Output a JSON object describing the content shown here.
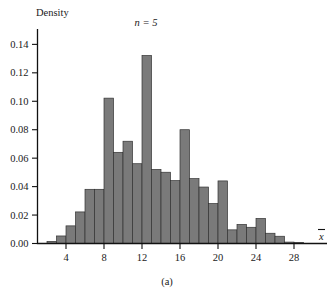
{
  "figure": {
    "caption": "(a)",
    "annotation": "n = 5",
    "xbar_symbol": "x",
    "bar_fill_color": "#7a7a7a",
    "bar_edge_color": "#333333",
    "axis_color": "#111111"
  },
  "chart_data": {
    "type": "bar",
    "title": "",
    "subtitle": "",
    "annotations": [
      "n = 5"
    ],
    "xlabel": "x̄",
    "ylabel": "Density",
    "xlim": [
      1.0,
      30.0
    ],
    "ylim": [
      0.0,
      0.148
    ],
    "grid": false,
    "legend": null,
    "bin_width": 1,
    "x_tick_labels": [
      "4",
      "8",
      "12",
      "16",
      "20",
      "24",
      "28"
    ],
    "x_ticks": [
      4,
      8,
      12,
      16,
      20,
      24,
      28
    ],
    "y_tick_labels": [
      "0.00",
      "0.02",
      "0.04",
      "0.06",
      "0.08",
      "0.10",
      "0.12",
      "0.14"
    ],
    "y_ticks": [
      0.0,
      0.02,
      0.04,
      0.06,
      0.08,
      0.1,
      0.12,
      0.14
    ],
    "bin_starts": [
      2,
      3,
      4,
      5,
      6,
      7,
      8,
      9,
      10,
      11,
      12,
      13,
      14,
      15,
      16,
      17,
      18,
      19,
      20,
      21,
      22,
      23,
      24,
      25,
      26,
      27,
      28
    ],
    "categories": [
      "2-3",
      "3-4",
      "4-5",
      "5-6",
      "6-7",
      "7-8",
      "8-9",
      "9-10",
      "10-11",
      "11-12",
      "12-13",
      "13-14",
      "14-15",
      "15-16",
      "16-17",
      "17-18",
      "18-19",
      "19-20",
      "20-21",
      "21-22",
      "22-23",
      "23-24",
      "24-25",
      "25-26",
      "26-27",
      "27-28",
      "28-29"
    ],
    "values": [
      0.0015,
      0.0053,
      0.0124,
      0.0222,
      0.0381,
      0.0381,
      0.1022,
      0.0641,
      0.0719,
      0.0561,
      0.1322,
      0.0521,
      0.0501,
      0.0442,
      0.08,
      0.0456,
      0.0397,
      0.0281,
      0.044,
      0.0096,
      0.0134,
      0.0114,
      0.0176,
      0.0072,
      0.0051,
      0.001,
      0.0008
    ]
  }
}
